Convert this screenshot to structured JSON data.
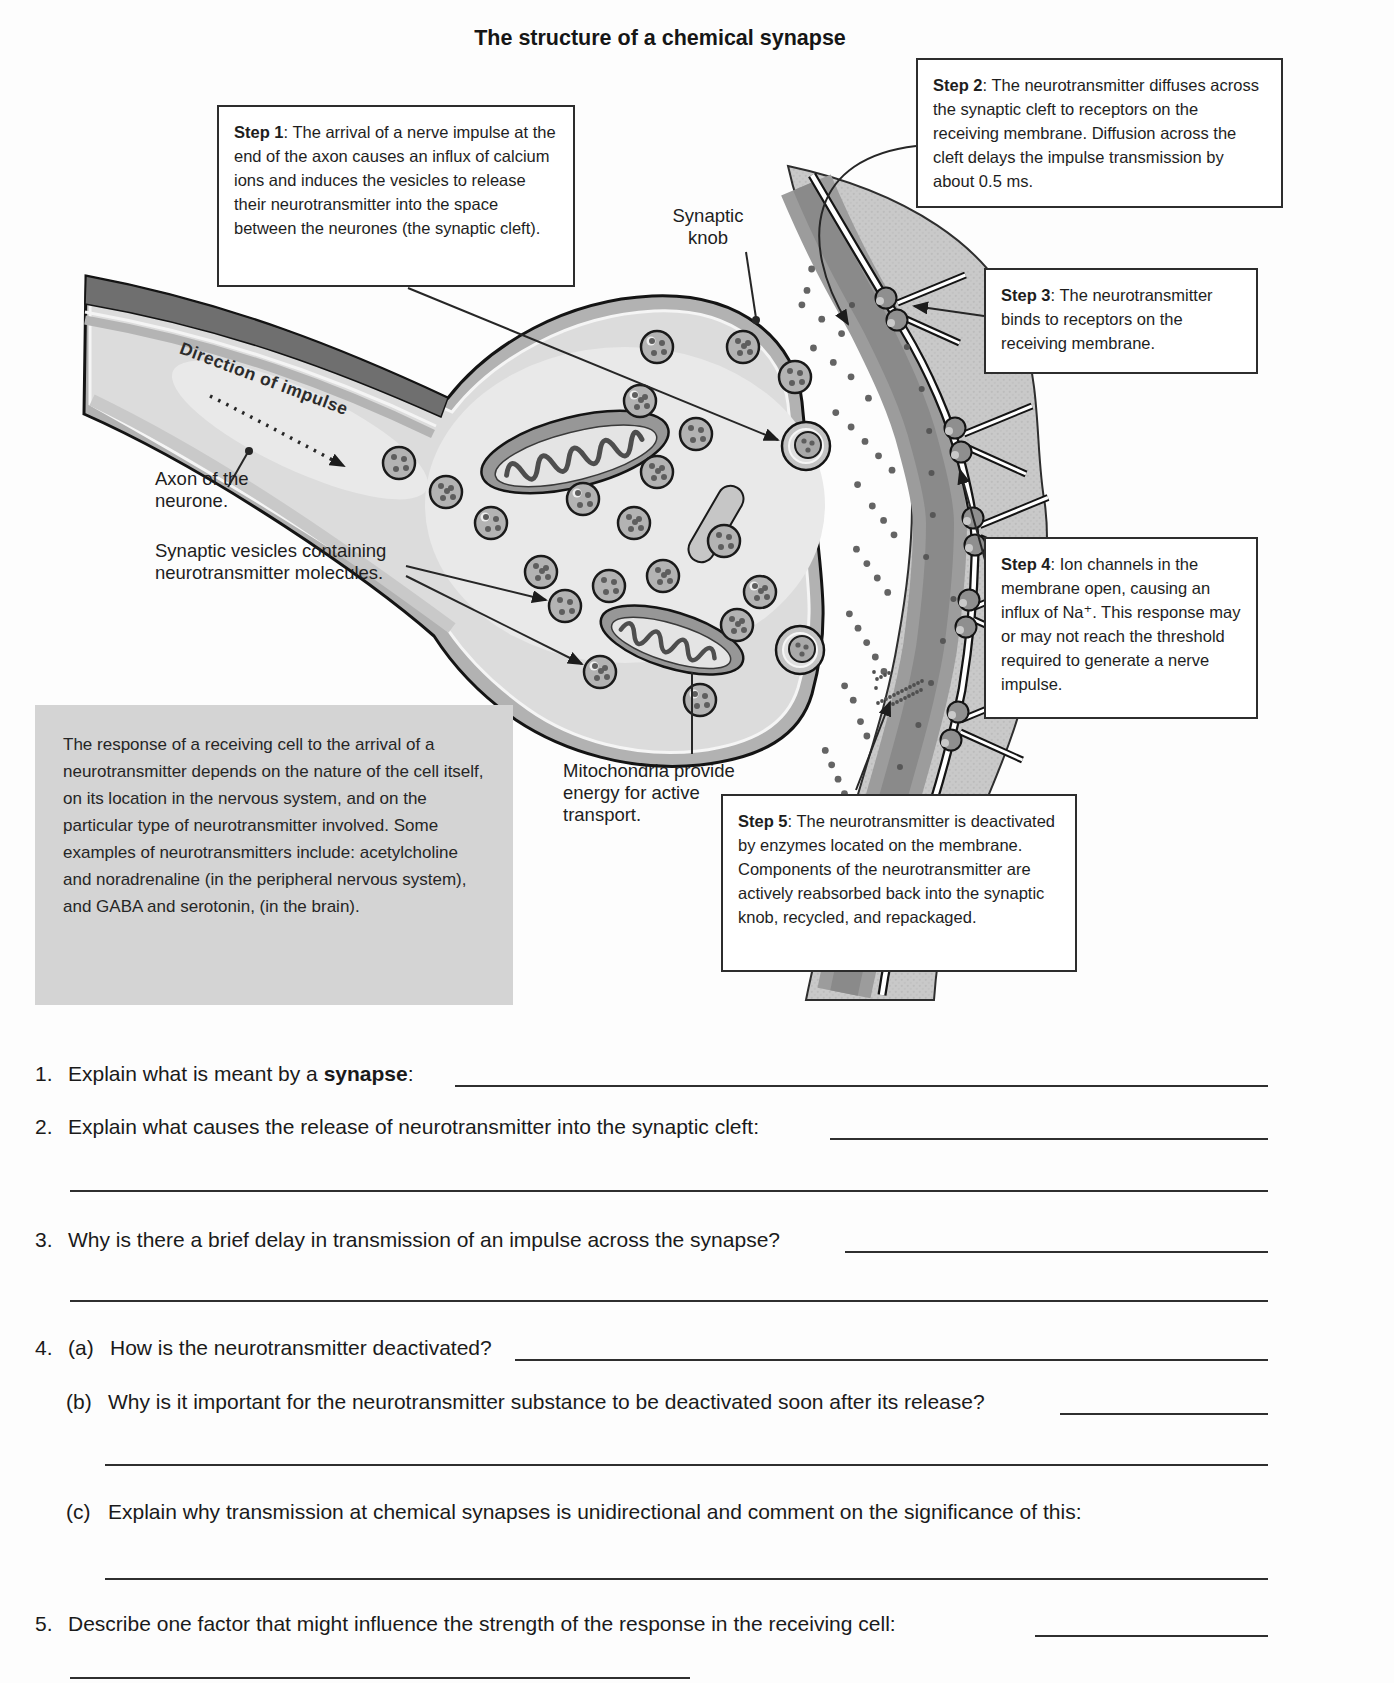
{
  "page": {
    "title": "The structure of a chemical synapse"
  },
  "colors": {
    "paper": "#fdfdfd",
    "ink": "#1d1d1d",
    "info_box_fill": "#d4d4d4",
    "cell_fill": "#c9c9c9",
    "membrane_gray": "#9c9c9c",
    "knob_interior": "#dcdcdc"
  },
  "callouts": {
    "step1": {
      "label": "Step 1",
      "text": ": The arrival of a nerve impulse at the end of the axon causes an influx of calcium ions and induces the vesicles to release their neurotransmitter into the space between the neurones (the synaptic cleft)."
    },
    "step2": {
      "label": "Step 2",
      "text": ": The neurotransmitter diffuses across the synaptic cleft to receptors on the receiving membrane. Diffusion across the cleft delays the impulse transmission by about 0.5 ms."
    },
    "step3": {
      "label": "Step 3",
      "text": ": The neurotransmitter binds to receptors on the receiving membrane."
    },
    "step4": {
      "label": "Step 4",
      "text": ": Ion channels in the membrane open, causing an influx of Na⁺. This response may or may not reach the threshold required to generate a nerve impulse."
    },
    "step5": {
      "label": "Step 5",
      "text": ": The neurotransmitter is deactivated by enzymes located on the membrane. Components of the neurotransmitter are actively reabsorbed back into the synaptic knob, recycled, and repackaged."
    }
  },
  "info_box": {
    "text": "The response of a receiving cell to the arrival of a neurotransmitter depends on the nature of the cell itself, on its location in the nervous system, and on the particular type of neurotransmitter involved. Some examples of neurotransmitters include: acetylcholine and noradrenaline (in the peripheral nervous system), and GABA and serotonin, (in the brain)."
  },
  "labels": {
    "direction_of_impulse": "Direction of impulse",
    "synaptic_knob": "Synaptic knob",
    "axon": "Axon of the neurone.",
    "vesicles": "Synaptic vesicles containing neurotransmitter molecules.",
    "mitochondria": "Mitochondria provide energy for active transport."
  },
  "questions": {
    "q1": {
      "num": "1.",
      "pre": "Explain what is meant by a ",
      "bold": "synapse",
      "post": ":"
    },
    "q2": {
      "num": "2.",
      "text": "Explain what causes the release of neurotransmitter into the synaptic cleft:"
    },
    "q3": {
      "num": "3.",
      "text": "Why is there a brief delay in transmission of an impulse across the synapse?"
    },
    "q4a": {
      "num": "4.",
      "letter": "(a)",
      "text": "How is the neurotransmitter deactivated?"
    },
    "q4b": {
      "letter": "(b)",
      "text": "Why is it important for the neurotransmitter substance to be deactivated soon after its release?"
    },
    "q4c": {
      "letter": "(c)",
      "text": "Explain why transmission at chemical synapses is unidirectional and comment on the significance of this:"
    },
    "q5": {
      "num": "5.",
      "text": "Describe one factor that might influence the strength of the response in the receiving cell:"
    }
  }
}
